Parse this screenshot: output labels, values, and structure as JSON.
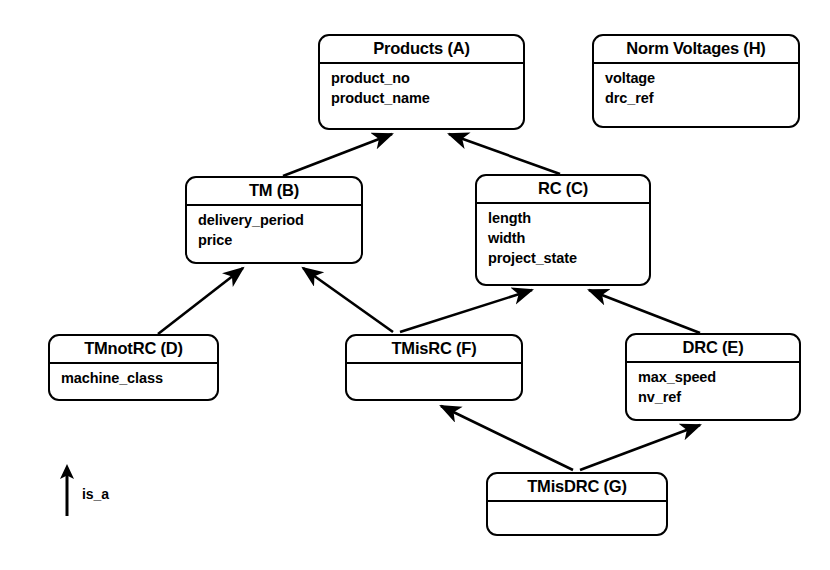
{
  "diagram": {
    "kind": "class-hierarchy-diagram",
    "background_color": "#ffffff",
    "line_color": "#000000",
    "legend": {
      "icon": "up-arrow-icon",
      "label": "is_a"
    },
    "entities": [
      {
        "id": "A",
        "name": "Products (A)",
        "attributes": [
          "product_no",
          "product_name"
        ],
        "x": 318,
        "y": 34,
        "w": 207,
        "h": 96
      },
      {
        "id": "H",
        "name": "Norm Voltages (H)",
        "attributes": [
          "voltage",
          "drc_ref"
        ],
        "x": 592,
        "y": 34,
        "w": 208,
        "h": 94
      },
      {
        "id": "B",
        "name": "TM (B)",
        "attributes": [
          "delivery_period",
          "price"
        ],
        "x": 185,
        "y": 176,
        "w": 178,
        "h": 88
      },
      {
        "id": "C",
        "name": "RC (C)",
        "attributes": [
          "length",
          "width",
          "project_state"
        ],
        "x": 475,
        "y": 174,
        "w": 176,
        "h": 112
      },
      {
        "id": "D",
        "name": "TMnotRC (D)",
        "attributes": [
          "machine_class"
        ],
        "x": 48,
        "y": 334,
        "w": 171,
        "h": 67
      },
      {
        "id": "F",
        "name": "TMisRC (F)",
        "attributes": [],
        "x": 345,
        "y": 334,
        "w": 178,
        "h": 67
      },
      {
        "id": "E",
        "name": "DRC (E)",
        "attributes": [
          "max_speed",
          "nv_ref"
        ],
        "x": 625,
        "y": 333,
        "w": 176,
        "h": 88
      },
      {
        "id": "G",
        "name": "TMisDRC (G)",
        "attributes": [],
        "x": 486,
        "y": 472,
        "w": 182,
        "h": 64
      }
    ],
    "relationships": [
      {
        "from": "B",
        "to": "A",
        "type": "is_a"
      },
      {
        "from": "C",
        "to": "A",
        "type": "is_a"
      },
      {
        "from": "D",
        "to": "B",
        "type": "is_a"
      },
      {
        "from": "F",
        "to": "B",
        "type": "is_a"
      },
      {
        "from": "F",
        "to": "C",
        "type": "is_a"
      },
      {
        "from": "E",
        "to": "C",
        "type": "is_a"
      },
      {
        "from": "G",
        "to": "F",
        "type": "is_a"
      },
      {
        "from": "G",
        "to": "E",
        "type": "is_a"
      }
    ]
  }
}
